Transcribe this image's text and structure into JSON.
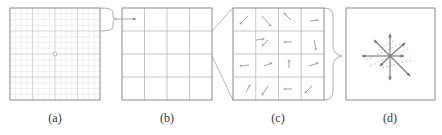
{
  "figure": {
    "panels": [
      {
        "id": "a",
        "label": "(a)",
        "description": "fine grid with center point",
        "grid": 4,
        "subdivisions": 4
      },
      {
        "id": "b",
        "label": "(b)",
        "description": "coarse 4x4 cell grid",
        "grid": 4
      },
      {
        "id": "c",
        "label": "(c)",
        "description": "4x4 cell grid with per-cell orientation arrows",
        "grid": 4
      },
      {
        "id": "d",
        "label": "(d)",
        "description": "8-direction orientation histogram star"
      }
    ],
    "colors": {
      "frame": "#8a8a8a",
      "grid": "#b5b5b5",
      "fine_grid": "#e3e3e3",
      "arrow": "#8c8c8c",
      "connector": "#9a9a9a"
    }
  }
}
